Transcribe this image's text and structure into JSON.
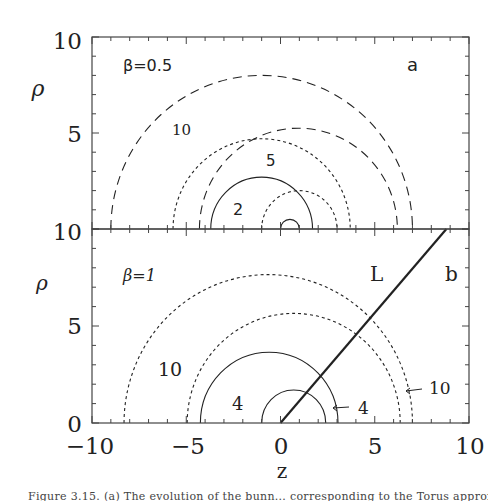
{
  "chart_data": [
    {
      "panel": "a",
      "type": "line",
      "title": "",
      "annotation": "β=0.5",
      "panel_label": "a",
      "xlabel": "",
      "ylabel": "ρ",
      "xlim": [
        -10,
        10
      ],
      "ylim": [
        0,
        10
      ],
      "yticks_labels": [
        "10",
        "5",
        "10"
      ],
      "grid": false,
      "curves": [
        {
          "name": "10",
          "style": "long-dash",
          "shape": "semicircle",
          "center_z": -1.0,
          "radius": 8.0
        },
        {
          "name": "10 (second)",
          "style": "long-dash",
          "shape": "semicircle",
          "center_z": 0.95,
          "radius": 5.25
        },
        {
          "name": "5",
          "style": "dotted",
          "shape": "semicircle",
          "center_z": -1.0,
          "radius": 4.7
        },
        {
          "name": "5 (second)",
          "style": "dotted",
          "shape": "semicircle",
          "center_z": 1.0,
          "radius": 2.0
        },
        {
          "name": "2",
          "style": "solid",
          "shape": "semicircle",
          "center_z": -1.0,
          "radius": 2.7
        },
        {
          "name": "2 (second)",
          "style": "solid",
          "shape": "semicircle",
          "center_z": 0.5,
          "radius": 0.5
        }
      ],
      "labels": [
        {
          "text": "10",
          "z": -3.6,
          "rho": 6.0
        },
        {
          "text": "5",
          "z": -0.9,
          "rho": 3.2
        },
        {
          "text": "2",
          "z": -2.1,
          "rho": 0.9
        },
        {
          "text": "β=0.5",
          "z": -6.8,
          "rho": 8.6
        },
        {
          "text": "a",
          "z": 7.3,
          "rho": 8.6
        }
      ]
    },
    {
      "panel": "b",
      "type": "line",
      "title": "",
      "annotation": "β=1",
      "panel_label": "b",
      "xlabel": "z",
      "ylabel": "ρ",
      "xlim": [
        -10,
        10
      ],
      "ylim": [
        0,
        10
      ],
      "xticks": [
        -10,
        -5,
        0,
        5,
        10
      ],
      "yticks": [
        0,
        5,
        10
      ],
      "grid": false,
      "curves": [
        {
          "name": "10",
          "style": "dotted",
          "shape": "semicircle",
          "center_z": -0.65,
          "radius": 7.65
        },
        {
          "name": "10 (second)",
          "style": "dotted",
          "shape": "semicircle",
          "center_z": 0.7,
          "radius": 5.65
        },
        {
          "name": "4",
          "style": "solid",
          "shape": "semicircle",
          "center_z": -0.6,
          "radius": 3.65
        },
        {
          "name": "4 (second)",
          "style": "solid",
          "shape": "semicircle",
          "center_z": 0.7,
          "radius": 1.7
        },
        {
          "name": "L",
          "style": "solid-thick",
          "shape": "line",
          "x": [
            0,
            8.8
          ],
          "y": [
            0,
            10
          ]
        }
      ],
      "labels": [
        {
          "text": "10",
          "z": -4.7,
          "rho": 2.5
        },
        {
          "text": "4",
          "z": -2.0,
          "rho": 0.6
        },
        {
          "text": "L",
          "z": 5.3,
          "rho": 8.2
        },
        {
          "text": "b",
          "z": 8.8,
          "rho": 8.2
        },
        {
          "text": "β=1",
          "z": -6.8,
          "rho": 8.2
        },
        {
          "text": "4",
          "z": 4.1,
          "rho": 0.7,
          "arrow_to_z": 3.0
        },
        {
          "text": "10",
          "z": 8.3,
          "rho": 1.5,
          "arrow_to_z": 7.0
        }
      ]
    }
  ],
  "axes": {
    "x_tick_labels": [
      "−10",
      "−5",
      "0",
      "5",
      "10"
    ],
    "x_label": "z",
    "y_label": "ρ",
    "top_y_tick_labels": [
      "10",
      "5",
      "10"
    ],
    "bottom_y_tick_labels": [
      "10",
      "5",
      "0"
    ]
  },
  "panels": {
    "a": {
      "beta_label": "β=0.5",
      "panel_letter": "a",
      "curve_labels": [
        "10",
        "5",
        "2"
      ]
    },
    "b": {
      "beta_label": "β=1",
      "panel_letter": "b",
      "line_label": "L",
      "curve_labels": [
        "10",
        "4"
      ],
      "arrow_labels": [
        "4",
        "10"
      ]
    }
  },
  "caption": "Figure 3.15.  (a) The evolution of the bunn... corresponding to the Torus approx..."
}
